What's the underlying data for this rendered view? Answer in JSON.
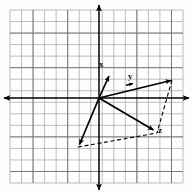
{
  "figure": {
    "background_color": "#fdfdfd",
    "grid": {
      "color": "#9a9aa0",
      "major_color": "#6e6e76",
      "left": 10,
      "top": 10,
      "right": 183,
      "bottom": 183,
      "cell": 11.53,
      "cols": 15,
      "rows": 15,
      "visible": true
    },
    "axes": {
      "color": "#000000",
      "origin_x": 99,
      "origin_y": 98,
      "x_axis": {
        "x1": 5,
        "y1": 98,
        "x2": 188,
        "y2": 98,
        "arrows": "both"
      },
      "y_axis": {
        "x1": 99,
        "y1": 6,
        "x2": 99,
        "y2": 189,
        "arrows": "both"
      }
    },
    "vectors": [
      {
        "name": "x",
        "label": "x",
        "label_x": 100,
        "label_y": 62,
        "tail_x": 99,
        "tail_y": 98,
        "tip_x": 110,
        "tip_y": 74,
        "style": "solid",
        "color": "#000000"
      },
      {
        "name": "y",
        "label": "y",
        "label_x": 128,
        "label_y": 73,
        "tail_x": 99,
        "tail_y": 98,
        "tip_x": 172,
        "tip_y": 80,
        "style": "solid",
        "color": "#000000",
        "mid_arrow": true
      },
      {
        "name": "z",
        "label": "z",
        "label_x": 158,
        "label_y": 126,
        "tail_x": 99,
        "tail_y": 98,
        "tip_x": 155,
        "tip_y": 131,
        "style": "solid",
        "color": "#000000"
      },
      {
        "name": "resultant-lower-left",
        "label": "",
        "label_x": 0,
        "label_y": 0,
        "tail_x": 99,
        "tail_y": 98,
        "tip_x": 78,
        "tip_y": 147,
        "style": "solid",
        "color": "#000000"
      }
    ],
    "dashed_segments": [
      {
        "name": "dashed-right-edge",
        "x1": 172,
        "y1": 80,
        "x2": 157,
        "y2": 133
      },
      {
        "name": "dashed-bottom-edge",
        "x1": 78,
        "y1": 147,
        "x2": 157,
        "y2": 133
      },
      {
        "name": "dashed-stub-left",
        "x1": 78,
        "y1": 147,
        "x2": 90,
        "y2": 144
      },
      {
        "name": "dashed-stub-z",
        "x1": 140,
        "y1": 136,
        "x2": 150,
        "y2": 133
      }
    ],
    "labels": {
      "x": "x",
      "y": "y",
      "z": "z"
    }
  }
}
